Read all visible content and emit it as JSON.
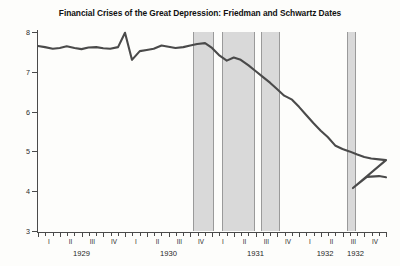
{
  "chart_data": {
    "type": "line",
    "title": "Financial Crises of the Great Depression: Friedman and Schwartz Dates",
    "xlabel": "",
    "ylabel": "",
    "ylim": [
      3,
      8
    ],
    "xlim": [
      1929.0,
      1933.0
    ],
    "grid": false,
    "legend": false,
    "y_ticks": [
      3,
      4,
      5,
      6,
      7,
      8
    ],
    "quarter_ticks": [
      "I",
      "II",
      "III",
      "IV",
      "I",
      "II",
      "III",
      "IV",
      "I",
      "II",
      "III",
      "IV",
      "I",
      "II",
      "III",
      "IV"
    ],
    "year_labels": [
      "1929",
      "1930",
      "1931",
      "1932",
      "1932"
    ],
    "series": [
      {
        "name": "money stock",
        "x": [
          1929.0,
          1929.08,
          1929.17,
          1929.25,
          1929.33,
          1929.42,
          1929.5,
          1929.58,
          1929.67,
          1929.75,
          1929.83,
          1929.92,
          1930.0,
          1930.08,
          1930.17,
          1930.25,
          1930.33,
          1930.42,
          1930.5,
          1930.58,
          1930.67,
          1930.75,
          1930.83,
          1930.92,
          1931.0,
          1931.08,
          1931.17,
          1931.25,
          1931.33,
          1931.42,
          1931.5,
          1931.58,
          1931.67,
          1931.75,
          1931.83,
          1931.92,
          1932.0,
          1932.08,
          1932.17,
          1932.25,
          1932.33,
          1932.42,
          1932.5,
          1932.58,
          1932.67,
          1932.75,
          1932.83,
          1932.92,
          1933.0
        ],
        "y": [
          7.65,
          7.62,
          7.58,
          7.6,
          7.64,
          7.6,
          7.57,
          7.61,
          7.62,
          7.59,
          7.58,
          7.62,
          7.98,
          7.3,
          7.52,
          7.55,
          7.58,
          7.66,
          7.63,
          7.6,
          7.62,
          7.66,
          7.7,
          7.72,
          7.6,
          7.42,
          7.28,
          7.36,
          7.3,
          7.16,
          7.02,
          6.88,
          6.72,
          6.56,
          6.4,
          6.3,
          6.12,
          5.92,
          5.7,
          5.52,
          5.36,
          5.14,
          5.06,
          5.0,
          4.92,
          4.86,
          4.82,
          4.8,
          4.78
        ],
        "color": "#4a4a4a"
      }
    ],
    "crisis_bands": [
      {
        "start": 1930.78,
        "end": 1931.02
      },
      {
        "start": 1931.12,
        "end": 1931.5
      },
      {
        "start": 1931.56,
        "end": 1931.78
      },
      {
        "start": 1932.55,
        "end": 1932.66
      }
    ],
    "band_color": "#d9d9d9",
    "tail_note": "series continues to a trough near 4.1 then recovers to about 4.35"
  },
  "accessibility": {
    "y_axis_name": "value",
    "x_axis_name": "quarter"
  }
}
